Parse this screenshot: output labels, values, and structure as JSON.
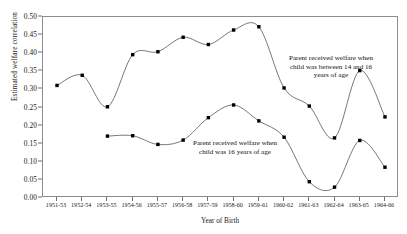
{
  "chart_data": {
    "type": "line",
    "title": "",
    "xlabel": "Year of Birth",
    "ylabel": "Estimated welfare correlation",
    "ylim": [
      0.0,
      0.5
    ],
    "ytick_labels": [
      "0.00",
      "0.05",
      "0.10",
      "0.15",
      "0.20",
      "0.25",
      "0.30",
      "0.35",
      "0.40",
      "0.45",
      "0.50"
    ],
    "ytick_values": [
      0.0,
      0.05,
      0.1,
      0.15,
      0.2,
      0.25,
      0.3,
      0.35,
      0.4,
      0.45,
      0.5
    ],
    "grid": false,
    "legend_position": "inline-annotations",
    "categories": [
      "1951-53",
      "1952-54",
      "1953-55",
      "1954-56",
      "1955-57",
      "1956-58",
      "1957-59",
      "1958-60",
      "1959-61",
      "1960-62",
      "1961-63",
      "1962-64",
      "1963-65",
      "1964-66"
    ],
    "series": [
      {
        "name": "Parent received welfare when child was between 14 and 16 years of age",
        "values": [
          0.311,
          0.339,
          0.252,
          0.396,
          0.404,
          0.444,
          0.424,
          0.464,
          0.473,
          0.304,
          0.254,
          0.166,
          0.352,
          0.224
        ]
      },
      {
        "name": "Parent received welfare when child was 16 years of age",
        "values": [
          null,
          null,
          0.171,
          0.172,
          0.148,
          0.16,
          0.222,
          0.257,
          0.213,
          0.168,
          0.045,
          0.03,
          0.159,
          0.085
        ]
      }
    ],
    "annotations": [
      {
        "id": "upper",
        "text": "Parent received welfare when\nchild was between 14 and 16\nyears of age"
      },
      {
        "id": "lower",
        "text": "Parent received welfare when\nchild was 16 years of age"
      }
    ],
    "colors": {
      "line": "#555555",
      "marker": "#000000",
      "frame": "#8d8d8d",
      "text": "#111111"
    }
  }
}
